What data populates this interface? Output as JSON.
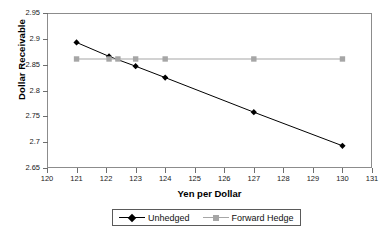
{
  "chart_data": {
    "type": "line",
    "title": "",
    "xlabel": "Yen per Dollar",
    "ylabel": "Dollar Receivable",
    "xlim": [
      120,
      131
    ],
    "ylim": [
      2.65,
      2.95
    ],
    "xticks": [
      120,
      121,
      122,
      123,
      124,
      125,
      126,
      127,
      128,
      129,
      130,
      131
    ],
    "xtick_labels": [
      "120",
      "121",
      "122",
      "123",
      "124",
      "125",
      "126",
      "127",
      "128",
      "129",
      "130",
      "131"
    ],
    "yticks": [
      2.65,
      2.7,
      2.75,
      2.8,
      2.85,
      2.9,
      2.95
    ],
    "ytick_labels": [
      "2.65",
      "2.7",
      "2.75",
      "2.8",
      "2.85",
      "2.9",
      "2.95"
    ],
    "grid": false,
    "legend_position": "bottom",
    "series": [
      {
        "name": "Unhedged",
        "color": "#000000",
        "marker": "diamond",
        "x": [
          121,
          122.1,
          123,
          124,
          127,
          130
        ],
        "values": [
          2.893,
          2.866,
          2.847,
          2.825,
          2.758,
          2.693
        ]
      },
      {
        "name": "Forward Hedge",
        "color": "#a6a6a6",
        "marker": "square",
        "x": [
          121,
          122.1,
          122.4,
          123,
          124,
          127,
          130
        ],
        "values": [
          2.861,
          2.861,
          2.861,
          2.861,
          2.861,
          2.861,
          2.861
        ]
      }
    ]
  },
  "legend": {
    "entries": [
      {
        "label": "Unhedged"
      },
      {
        "label": "Forward Hedge"
      }
    ]
  },
  "colors": {
    "unhedged": "#000000",
    "forward_hedge": "#a6a6a6",
    "axis": "#8c8c8c",
    "text": "#111111"
  }
}
